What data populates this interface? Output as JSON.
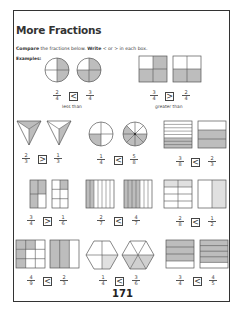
{
  "title": "More Fractions",
  "instructions": {
    "compare": "Compare",
    "mid": " the fractions below. ",
    "write": "Write",
    "rest": " < or > in each box."
  },
  "examples_label": "Examples:",
  "shade_color": "#bdbdbd",
  "examples": [
    {
      "left": {
        "num": "2",
        "den": "4"
      },
      "symbol": "<",
      "right": {
        "num": "3",
        "den": "4"
      },
      "caption": "less than",
      "shape": "circle"
    },
    {
      "left": {
        "num": "3",
        "den": "4"
      },
      "symbol": ">",
      "right": {
        "num": "2",
        "den": "4"
      },
      "caption": "greater than",
      "shape": "square"
    }
  ],
  "problems": [
    {
      "left": {
        "num": "2",
        "den": "3"
      },
      "symbol": ">",
      "right": {
        "num": "1",
        "den": "3"
      },
      "shape": "triangle"
    },
    {
      "left": {
        "num": "1",
        "den": "4"
      },
      "symbol": "<",
      "right": {
        "num": "5",
        "den": "8"
      },
      "shape": "circle"
    },
    {
      "left": {
        "num": "3",
        "den": "8"
      },
      "symbol": "<",
      "right": {
        "num": "2",
        "den": "3"
      },
      "shape": "horizontal-bars"
    },
    {
      "left": {
        "num": "3",
        "den": "4"
      },
      "symbol": ">",
      "right": {
        "num": "1",
        "den": "6"
      },
      "shape": "grid"
    },
    {
      "left": {
        "num": "2",
        "den": "7"
      },
      "symbol": "<",
      "right": {
        "num": "4",
        "den": "7"
      },
      "shape": "vertical-bars"
    },
    {
      "left": {
        "num": "2",
        "den": "8"
      },
      "symbol": "<",
      "right": {
        "num": "1",
        "den": "2"
      },
      "shape": "grid"
    },
    {
      "left": {
        "num": "4",
        "den": "9"
      },
      "symbol": "<",
      "right": {
        "num": "2",
        "den": "3"
      },
      "shape": "grid"
    },
    {
      "left": {
        "num": "1",
        "den": "4"
      },
      "symbol": "<",
      "right": {
        "num": "3",
        "den": "6"
      },
      "shape": "hexagon"
    },
    {
      "left": {
        "num": "3",
        "den": "4"
      },
      "symbol": "<",
      "right": {
        "num": "4",
        "den": "5"
      },
      "shape": "horizontal-bars"
    }
  ],
  "page_number": "171"
}
